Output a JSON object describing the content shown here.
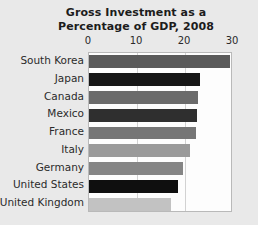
{
  "chart_data": {
    "type": "bar",
    "orientation": "horizontal",
    "title": "Gross Investment as a Percentage of GDP, 2008",
    "title_line1": "Gross Investment as a",
    "title_line2": "Percentage of GDP, 2008",
    "xlabel": "",
    "ylabel": "",
    "xlim": [
      0,
      30
    ],
    "xticks": [
      0,
      10,
      20,
      30
    ],
    "xtick_labels": [
      "0",
      "10",
      "20",
      "30"
    ],
    "grid": true,
    "grid_axis": "x",
    "legend": false,
    "categories": [
      "South Korea",
      "Japan",
      "Canada",
      "Mexico",
      "France",
      "Italy",
      "Germany",
      "United States",
      "United Kingdom"
    ],
    "values": [
      29.4,
      23.2,
      22.8,
      22.6,
      22.3,
      21.0,
      19.5,
      18.5,
      17.0
    ],
    "bar_colors": [
      "#5a5a5a",
      "#161616",
      "#6b6b6b",
      "#2f2f2f",
      "#767676",
      "#9a9a9a",
      "#858585",
      "#0f0f0f",
      "#c2c2c2"
    ],
    "plot_background": "#fdfdfd",
    "page_background": "#e9e9e9",
    "grid_color": "#d2d2d2",
    "axis_border_color": "#b9b9b9",
    "text_color": "#1c1c1c"
  }
}
